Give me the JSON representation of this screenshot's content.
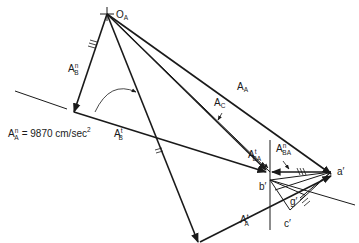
{
  "diagram": {
    "type": "acceleration-polygon",
    "origin_label": {
      "main": "O",
      "sub": "A"
    },
    "labels": {
      "A_A": {
        "main": "A",
        "sub": "A"
      },
      "A_C": {
        "main": "A",
        "sub": "C"
      },
      "A_B_n": {
        "main": "A",
        "sup": "n",
        "sub": "B"
      },
      "A_B_t": {
        "main": "A",
        "sup": "t",
        "sub": "B"
      },
      "A_A_t": {
        "main": "A",
        "sup": "t",
        "sub": "A"
      },
      "A_BA_t": {
        "main": "A",
        "sup": "t",
        "sub": "BA"
      },
      "A_BA_n": {
        "main": "A",
        "sup": "n",
        "sub": "BA"
      },
      "a_prime": "a′",
      "b_prime": "b′",
      "c_prime": "c′",
      "g_prime": "g′"
    },
    "annotation": {
      "main": "A",
      "sup": "n",
      "sub": "A",
      "equals": "= 9870 cm/sec",
      "exp": "2"
    },
    "colors": {
      "line": "#1a1a1a",
      "background": "#ffffff"
    }
  }
}
